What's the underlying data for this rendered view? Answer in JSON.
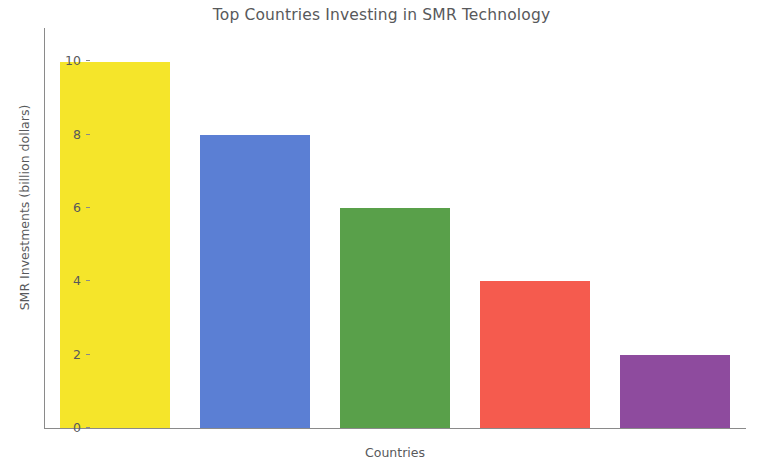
{
  "chart_data": {
    "type": "bar",
    "title": "Top Countries Investing in SMR Technology",
    "xlabel": "Countries",
    "ylabel": "SMR Investments (billion dollars)",
    "categories": [
      "China",
      "USA",
      "UK",
      "France",
      "Argentina"
    ],
    "values": [
      10,
      8,
      6,
      4,
      2
    ],
    "colors": [
      "#F5E52A",
      "#5B7FD4",
      "#59A04A",
      "#F55B4E",
      "#8E4B9E"
    ],
    "ylim": [
      0,
      10.45
    ],
    "yticks": [
      0,
      2,
      4,
      6,
      8,
      10
    ],
    "ytick_labels": [
      "0",
      "2",
      "4",
      "6",
      "8",
      "10"
    ],
    "grid": false,
    "legend": false,
    "background": "#FFFFFF",
    "axis_color": "#8A8A8A",
    "text_color": "#58595B"
  }
}
